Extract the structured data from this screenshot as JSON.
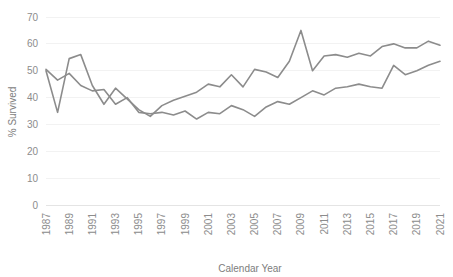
{
  "chart_data": {
    "type": "line",
    "title": "",
    "xlabel": "Calendar Year",
    "ylabel": "% Survived",
    "xlim": [
      1987,
      2021
    ],
    "ylim": [
      0,
      70
    ],
    "ytick_step": 10,
    "grid": true,
    "legend": "none",
    "line_color": "#8c8c8c",
    "gridline_color": "#f2f2f2",
    "tick_label_color": "#8c8c8c",
    "axis_title_color": "#7d7d7d",
    "x": [
      1987,
      1988,
      1989,
      1990,
      1991,
      1992,
      1993,
      1994,
      1995,
      1996,
      1997,
      1998,
      1999,
      2000,
      2001,
      2002,
      2003,
      2004,
      2005,
      2006,
      2007,
      2008,
      2009,
      2010,
      2011,
      2012,
      2013,
      2014,
      2015,
      2016,
      2017,
      2018,
      2019,
      2020,
      2021
    ],
    "xticklabels": [
      "1987",
      "1989",
      "1991",
      "1993",
      "1995",
      "1997",
      "1999",
      "2001",
      "2003",
      "2005",
      "2007",
      "2009",
      "2011",
      "2013",
      "2015",
      "2017",
      "2019",
      "2021"
    ],
    "yticklabels": [
      "0",
      "10",
      "20",
      "30",
      "40",
      "50",
      "60",
      "70"
    ],
    "series": [
      {
        "name": "Series 1",
        "values": [
          50.0,
          34.5,
          54.5,
          56.0,
          44.5,
          37.5,
          43.5,
          39.5,
          35.5,
          33.0,
          37.0,
          39.0,
          40.5,
          42.0,
          45.0,
          44.0,
          48.5,
          44.0,
          50.5,
          49.5,
          47.5,
          53.5,
          65.0,
          50.0,
          55.5,
          56.0,
          55.0,
          56.5,
          55.5,
          59.0,
          60.0,
          58.5,
          58.5,
          61.0,
          59.5
        ]
      },
      {
        "name": "Series 2",
        "values": [
          50.5,
          46.5,
          49.0,
          44.5,
          42.5,
          43.0,
          37.5,
          40.0,
          34.5,
          34.0,
          34.5,
          33.5,
          35.0,
          32.0,
          34.5,
          34.0,
          37.0,
          35.5,
          33.0,
          36.5,
          38.5,
          37.5,
          40.0,
          42.5,
          41.0,
          43.5,
          44.0,
          45.0,
          44.0,
          43.5,
          52.0,
          48.5,
          50.0,
          52.0,
          53.5
        ]
      }
    ]
  }
}
